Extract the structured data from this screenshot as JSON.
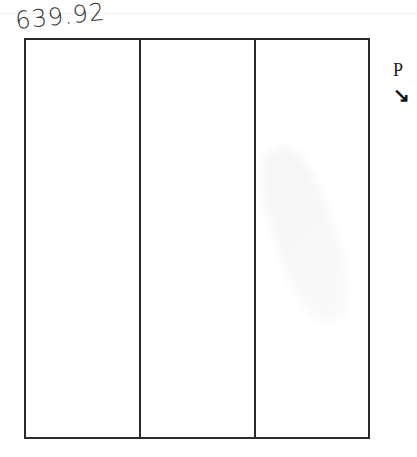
{
  "handwritten_amount": "639.92",
  "margin_label": "P",
  "margin_mark": "↘",
  "table": {
    "columns": 3,
    "cells": [
      "",
      "",
      ""
    ]
  }
}
